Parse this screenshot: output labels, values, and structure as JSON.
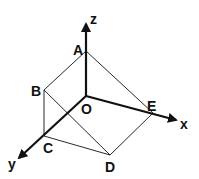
{
  "diagram": {
    "type": "3d-coordinate-wireframe",
    "axes": [
      {
        "name": "x",
        "label": "x"
      },
      {
        "name": "y",
        "label": "y"
      },
      {
        "name": "z",
        "label": "z"
      }
    ],
    "points": [
      {
        "name": "A",
        "label": "A"
      },
      {
        "name": "B",
        "label": "B"
      },
      {
        "name": "C",
        "label": "C"
      },
      {
        "name": "D",
        "label": "D"
      },
      {
        "name": "E",
        "label": "E"
      },
      {
        "name": "O",
        "label": "O"
      }
    ],
    "edges": [
      [
        "A",
        "B"
      ],
      [
        "A",
        "E"
      ],
      [
        "B",
        "C"
      ],
      [
        "B",
        "D"
      ],
      [
        "C",
        "D"
      ],
      [
        "D",
        "E"
      ]
    ],
    "colors": {
      "stroke": "#111111",
      "background": "#ffffff"
    }
  }
}
